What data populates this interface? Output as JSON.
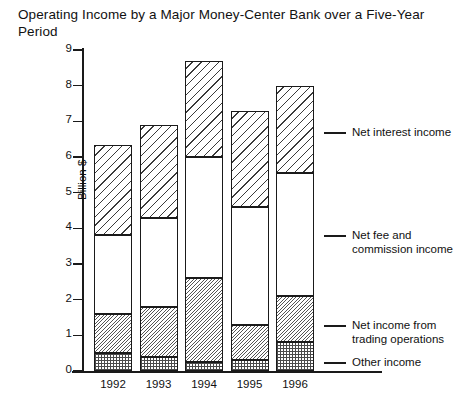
{
  "chart_data": {
    "type": "bar",
    "subtype": "stacked",
    "title": "Operating Income by a Major Money-Center Bank over a Five-Year Period",
    "xlabel": "",
    "ylabel": "Billion $",
    "categories": [
      "1992",
      "1993",
      "1994",
      "1995",
      "1996"
    ],
    "ylim": [
      0,
      9
    ],
    "yticks": [
      "0",
      "1",
      "2",
      "3",
      "4",
      "5",
      "6",
      "7",
      "8",
      "9"
    ],
    "grid": false,
    "legend_position": "right",
    "series": [
      {
        "name": "Other income",
        "pattern": "dots",
        "values": [
          0.5,
          0.4,
          0.25,
          0.3,
          0.8
        ]
      },
      {
        "name": "Net income from trading operations",
        "pattern": "hatch-fine",
        "values": [
          1.1,
          1.4,
          2.35,
          1.0,
          1.3
        ]
      },
      {
        "name": "Net fee and commission income",
        "pattern": "blank",
        "values": [
          2.2,
          2.5,
          3.4,
          3.3,
          3.45
        ]
      },
      {
        "name": "Net interest income",
        "pattern": "hatch-coarse",
        "values": [
          2.55,
          2.6,
          2.7,
          2.7,
          2.45
        ]
      }
    ],
    "totals": [
      6.35,
      6.9,
      8.7,
      7.3,
      8.0
    ]
  },
  "legend": [
    {
      "label": "Net interest income"
    },
    {
      "label": "Net fee and\ncommission income"
    },
    {
      "label": "Net income from\ntrading operations"
    },
    {
      "label": "Other income"
    }
  ],
  "colors": {
    "ink": "#1a1a1a",
    "background": "#ffffff"
  }
}
